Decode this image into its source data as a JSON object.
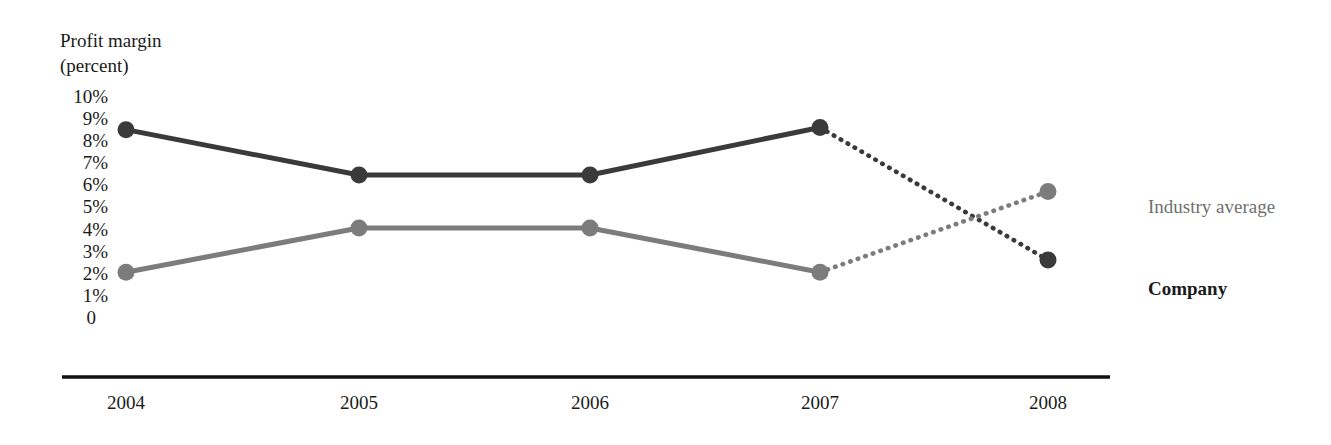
{
  "chart_data": {
    "type": "line",
    "title": "Profit margin (percent)",
    "title_lines": [
      "Profit margin",
      "(percent)"
    ],
    "xlabel": "",
    "ylabel": "Profit margin (percent)",
    "categories": [
      "2004",
      "2005",
      "2006",
      "2007",
      "2008"
    ],
    "ylim": [
      0,
      10
    ],
    "ytick_labels": [
      "10%",
      "9%",
      "8%",
      "7%",
      "6%",
      "5%",
      "4%",
      "3%",
      "2%",
      "1%",
      "0"
    ],
    "ytick_values": [
      10,
      9,
      8,
      7,
      6,
      5,
      4,
      3,
      2,
      1,
      0
    ],
    "grid": false,
    "legend_position": "right",
    "series": [
      {
        "name": "Company",
        "color": "#3a3a3a",
        "values": [
          8.5,
          6.45,
          6.45,
          8.6,
          2.6
        ],
        "solid_through_index": 3,
        "forecast_style": "dotted",
        "legend_label": "Company",
        "legend_weight": "bold"
      },
      {
        "name": "Industry average",
        "color": "#7c7c7c",
        "values": [
          2.05,
          4.05,
          4.05,
          2.05,
          5.7
        ],
        "solid_through_index": 3,
        "forecast_style": "dotted",
        "legend_label": "Industry average",
        "legend_weight": "normal"
      }
    ],
    "annotations": [
      "Solid line segments cover 2004-2007 (actual); dotted segments cover 2007-2008 (projected).",
      "The two projected segments cross between 2007 and 2008."
    ]
  },
  "axis": {
    "baseline_color": "#111111"
  }
}
